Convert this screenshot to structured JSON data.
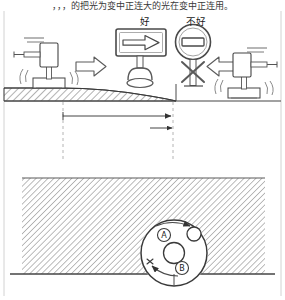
{
  "figure": {
    "header_text": "，，，的把光为变中正连大的光在变中正连用。",
    "labels": {
      "good": "好",
      "bad": "不好"
    },
    "circle_labels": {
      "a": "A",
      "b": "B"
    },
    "colors": {
      "line": "#444444",
      "line_light": "#777777",
      "hatch": "#555555",
      "text": "#1a1a1a",
      "header_text": "#3a3a3a",
      "frame": "#c8c8c8",
      "background": "#ffffff"
    },
    "upper_panel": {
      "sign_left_type": "arrow-right-sign",
      "sign_right_type": "prohibition-sign",
      "post_right_mark": "x-cross",
      "device_left": "vibration-source-device",
      "device_right": "vibration-source-device-mirrored",
      "arrow_left": "block-arrow-right",
      "arrow_right": "block-arrow-left",
      "embankment": "sloped-hatched-mound"
    },
    "dimension": {
      "type": "horizontal-dimension-arrow",
      "value": ""
    },
    "lower_panel": {
      "soil": "hatched-soil-section",
      "circle": "rotating-circular-element",
      "rotation": "curved-arrows"
    }
  }
}
